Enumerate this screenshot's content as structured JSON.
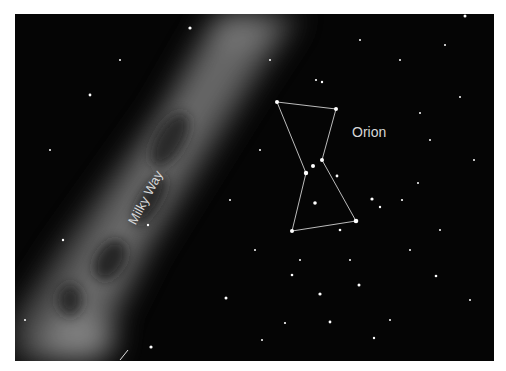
{
  "labels": {
    "constellation": "Orion",
    "galaxy_band": "Milky Way"
  },
  "colors": {
    "sky": "#050505",
    "milky_way": "#8a8a8a",
    "lines": "#d0d0d0",
    "border": "#ffffff"
  },
  "constellation": {
    "stars": [
      {
        "name": "top-left",
        "x": 277,
        "y": 102
      },
      {
        "name": "top-right",
        "x": 336,
        "y": 109
      },
      {
        "name": "belt-right",
        "x": 322,
        "y": 160
      },
      {
        "name": "belt-middle",
        "x": 313,
        "y": 166
      },
      {
        "name": "belt-left",
        "x": 306,
        "y": 173
      },
      {
        "name": "bottom-right",
        "x": 356,
        "y": 221
      },
      {
        "name": "bottom-left",
        "x": 292,
        "y": 231
      }
    ]
  }
}
